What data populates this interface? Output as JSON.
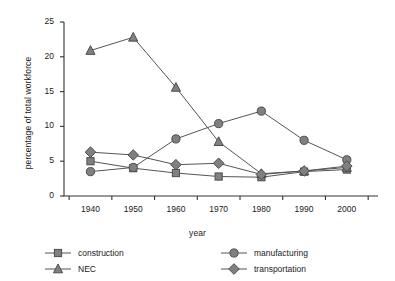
{
  "chart_data": {
    "type": "line",
    "title": "",
    "xlabel": "year",
    "ylabel": "percentage of total workforce",
    "x": [
      1940,
      1950,
      1960,
      1970,
      1980,
      1990,
      2000
    ],
    "xtick_labels": [
      "1940",
      "1950",
      "1960",
      "1970",
      "1980",
      "1990",
      "2000"
    ],
    "ytick_labels": [
      "0",
      "5",
      "10",
      "15",
      "20",
      "25"
    ],
    "yticks": [
      0,
      5,
      10,
      15,
      20,
      25
    ],
    "ylim": [
      0,
      25
    ],
    "xlim": [
      1935,
      2005
    ],
    "grid": false,
    "legend_position": "bottom",
    "series": [
      {
        "name": "construction",
        "marker": "square",
        "color": "#808080",
        "values": [
          5.0,
          4.0,
          3.3,
          2.8,
          2.7,
          3.5,
          3.8
        ]
      },
      {
        "name": "NEC",
        "marker": "triangle",
        "color": "#808080",
        "values": [
          20.9,
          22.8,
          15.6,
          7.8,
          3.2,
          3.6,
          4.1
        ]
      },
      {
        "name": "manufacturing",
        "marker": "circle",
        "color": "#808080",
        "values": [
          3.5,
          4.1,
          8.2,
          10.4,
          12.2,
          8.0,
          5.2
        ]
      },
      {
        "name": "transportation",
        "marker": "diamond",
        "color": "#808080",
        "values": [
          6.3,
          5.9,
          4.5,
          4.7,
          3.1,
          3.6,
          4.3
        ]
      }
    ]
  },
  "colors": {
    "axis": "#333333",
    "line": "#555555",
    "marker_fill": "#808080",
    "marker_stroke": "#4d4d4d",
    "text": "#1a1a1a",
    "background": "#ffffff"
  }
}
